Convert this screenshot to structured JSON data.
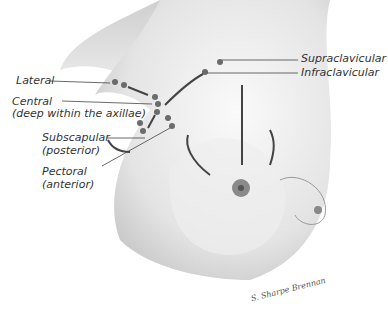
{
  "figure": {
    "labels": {
      "lateral": "Lateral",
      "central_1": "Central",
      "central_2": "(deep within the axillae)",
      "subscapular_1": "Subscapular",
      "subscapular_2": "(posterior)",
      "pectoral_1": "Pectoral",
      "pectoral_2": "(anterior)",
      "supraclavicular": "Supraclavicular",
      "infraclavicular": "Infraclavicular"
    },
    "signature": "S. Sharpe Brennan",
    "colors": {
      "skin_shadow": "#9a9a9a",
      "node": "#6b6b6b",
      "line": "#444444"
    }
  }
}
